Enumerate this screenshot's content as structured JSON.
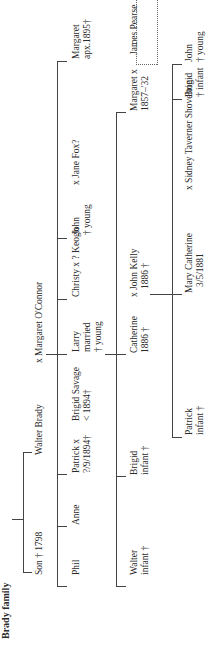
{
  "title": "Brady family",
  "page_number": "244",
  "generations": {
    "gen1": {
      "son": "Son † 1798",
      "walter": "Walter Brady",
      "spouse": "x  Margaret O'Connor"
    },
    "gen2": [
      {
        "name": "Phil"
      },
      {
        "name": "Anne"
      },
      {
        "name": "Patrick  x",
        "note": "?/9/1894†"
      },
      {
        "name": "Brigid Savage",
        "note": "< 1894†"
      },
      {
        "name": "Larry",
        "note1": "married",
        "note2": "† young"
      },
      {
        "name": "Christy x ? Keogh"
      },
      {
        "name": "John",
        "note": "† young"
      },
      {
        "name": "x  Jane Fox?"
      },
      {
        "name": "Margaret",
        "note": "apx.1895†"
      }
    ],
    "gen3": [
      {
        "name": "Walter",
        "note": "infant †"
      },
      {
        "name": "Brigid",
        "note": "infant †"
      },
      {
        "name": "Catherine",
        "note": "1886 †"
      },
      {
        "name": "x  John Kelly",
        "note": "1886 †"
      },
      {
        "name": "Margaret      x",
        "note": "1857–'32"
      },
      {
        "name": "James Pearse"
      }
    ],
    "gen4": [
      {
        "name": "Patrick",
        "note": "infant †"
      },
      {
        "name": "Mary Catherine",
        "note": "3/5/1881"
      },
      {
        "name": "x  Sidney Taverner Shovelton"
      },
      {
        "name": "Brigid",
        "note": "†  infant"
      },
      {
        "name": "John",
        "note": "† young"
      }
    ]
  }
}
